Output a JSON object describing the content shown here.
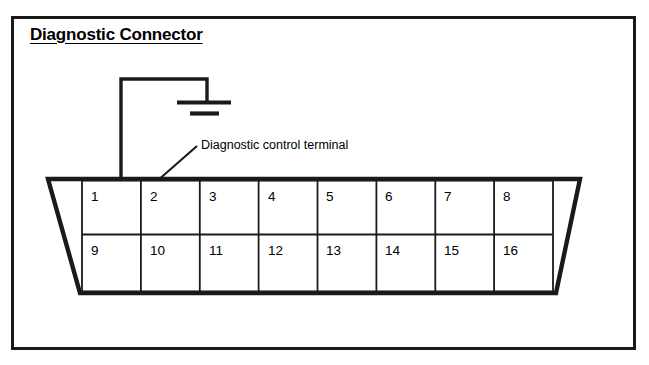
{
  "figure": {
    "title": "Diagnostic Connector",
    "background_color": "#ffffff",
    "line_color": "#1a1a1a",
    "border_color": "#1a1a1a"
  },
  "annotation": {
    "label": "Diagnostic control terminal",
    "pointer_icon": "arrow-pointer-icon",
    "points_to_pin": "1"
  },
  "ground_symbol": {
    "icon": "ground-symbol-icon",
    "description": "earth ground with two horizontal bars"
  },
  "connector": {
    "shape": "trapezoid",
    "rows": [
      {
        "row_name": "top-row",
        "pins": [
          "1",
          "2",
          "3",
          "4",
          "5",
          "6",
          "7",
          "8"
        ]
      },
      {
        "row_name": "bottom-row",
        "pins": [
          "9",
          "10",
          "11",
          "12",
          "13",
          "14",
          "15",
          "16"
        ]
      }
    ]
  }
}
